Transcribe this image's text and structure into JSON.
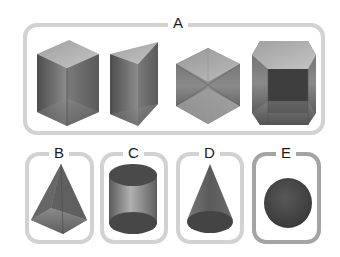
{
  "groups": [
    {
      "label": "A",
      "description": "prisms",
      "shapes": [
        "rectangular-prism",
        "triangular-prism",
        "hexagonal-prism-view",
        "hexagonal-prism"
      ]
    },
    {
      "label": "B",
      "description": "pyramid",
      "shapes": [
        "square-pyramid"
      ]
    },
    {
      "label": "C",
      "description": "cylinder",
      "shapes": [
        "cylinder"
      ]
    },
    {
      "label": "D",
      "description": "cone",
      "shapes": [
        "cone"
      ]
    },
    {
      "label": "E",
      "description": "sphere",
      "shapes": [
        "sphere"
      ]
    }
  ],
  "colors": {
    "frame": "#d2d2d2",
    "frame_highlight": "#a4a4a4",
    "shape_dark": "#3c3c3c",
    "shape_light": "#b8b8b8"
  }
}
